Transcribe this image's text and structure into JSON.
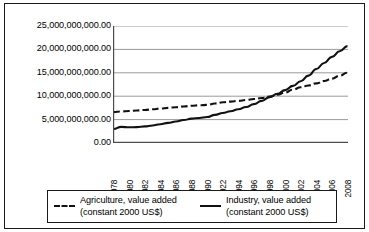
{
  "chart_data": {
    "type": "line",
    "title": "",
    "subtitle": "",
    "xlabel": "",
    "ylabel": "",
    "grid": true,
    "legend_position": "bottom",
    "xlim": [
      1978,
      2008
    ],
    "ylim": [
      0,
      25000000000
    ],
    "y_tick_labels": [
      "25,000,000,000.00",
      "20,000,000,000.00",
      "15,000,000,000.00",
      "10,000,000,000.00",
      "5,000,000,000.00",
      "0.00"
    ],
    "y_tick_values": [
      25000000000,
      20000000000,
      15000000000,
      10000000000,
      5000000000,
      0
    ],
    "categories": [
      "1978",
      "1979",
      "1980",
      "1981",
      "1982",
      "1983",
      "1984",
      "1985",
      "1986",
      "1987",
      "1988",
      "1989",
      "1990",
      "1991",
      "1922",
      "1993",
      "1994",
      "1995",
      "1996",
      "1997",
      "1998",
      "1999",
      "2000",
      "2001",
      "2002",
      "2003",
      "2004",
      "2005",
      "2006",
      "2007",
      "2008"
    ],
    "x_tick_labels_shown": [
      "1978",
      "1980",
      "1982",
      "1984",
      "1986",
      "1988",
      "1990",
      "1922",
      "1994",
      "1996",
      "1998",
      "2000",
      "2002",
      "2004",
      "2006",
      "2008"
    ],
    "series": [
      {
        "name": "Agriculture, value added (constant 2000 US$)",
        "style": "dashed",
        "color": "#111111",
        "values": [
          6600000000,
          6750000000,
          6850000000,
          6950000000,
          7050000000,
          7200000000,
          7350000000,
          7500000000,
          7650000000,
          7800000000,
          7950000000,
          8050000000,
          8150000000,
          8450000000,
          8700000000,
          8850000000,
          9000000000,
          9200000000,
          9400000000,
          9600000000,
          9900000000,
          10300000000,
          10800000000,
          11400000000,
          11900000000,
          12300000000,
          12750000000,
          13250000000,
          13750000000,
          14400000000,
          15000000000
        ]
      },
      {
        "name": "Industry, value added (constant 2000 US$)",
        "style": "solid",
        "color": "#111111",
        "values": [
          3000000000,
          3450000000,
          3350000000,
          3400000000,
          3550000000,
          3750000000,
          4000000000,
          4300000000,
          4600000000,
          4900000000,
          5200000000,
          5350000000,
          5550000000,
          6000000000,
          6400000000,
          6800000000,
          7200000000,
          7700000000,
          8300000000,
          9000000000,
          9800000000,
          10500000000,
          11300000000,
          12200000000,
          13200000000,
          14400000000,
          15800000000,
          17100000000,
          18400000000,
          19600000000,
          20700000000
        ]
      }
    ]
  },
  "legend": {
    "entries": [
      {
        "line1": "Agriculture, value added",
        "line2": "(constant 2000 US$)",
        "style": "dashed"
      },
      {
        "line1": "Industry, value added",
        "line2": "(constant 2000 US$)",
        "style": "solid"
      }
    ]
  },
  "colors": {
    "frame": "#1a1a1a",
    "gridline": "#9a9a9a",
    "axis": "#4d4d4d",
    "series": "#111111",
    "background": "#ffffff"
  }
}
